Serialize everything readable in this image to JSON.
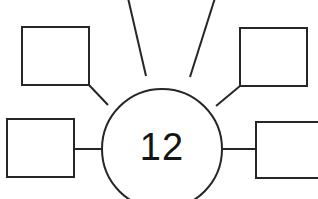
{
  "worksheet": {
    "type": "bubble-map",
    "title": "Number bubble map",
    "background_color": "#ffffff",
    "line_color": "#262626",
    "text_color": "#141414",
    "canvas": {
      "width": 318,
      "height": 199
    }
  },
  "center": {
    "label": "12",
    "shape": "circle",
    "cx": 162,
    "cy": 149,
    "r": 60,
    "fill": "#ffffff"
  },
  "nodes": [
    {
      "id": "node-top-left-offscreen",
      "label": "",
      "shape": "line-only",
      "note": "spoke exits top edge of image; box not visible"
    },
    {
      "id": "node-top-right-offscreen",
      "label": "",
      "shape": "line-only",
      "note": "spoke exits top edge of image; box not visible"
    },
    {
      "id": "node-upper-left",
      "label": "",
      "shape": "rect",
      "x": 22,
      "y": 27,
      "width": 67,
      "height": 58
    },
    {
      "id": "node-upper-right",
      "label": "",
      "shape": "rect",
      "x": 240,
      "y": 28,
      "width": 67,
      "height": 58
    },
    {
      "id": "node-middle-left",
      "label": "",
      "shape": "rect",
      "x": 7,
      "y": 119,
      "width": 67,
      "height": 58
    },
    {
      "id": "node-middle-right",
      "label": "",
      "shape": "rect",
      "x": 256,
      "y": 122,
      "width": 67,
      "height": 56
    }
  ],
  "connectors": [
    {
      "id": "connector-top-left",
      "x1": 146,
      "y1": 76,
      "x2": 128,
      "y2": -2
    },
    {
      "id": "connector-top-right",
      "x1": 190,
      "y1": 77,
      "x2": 215,
      "y2": -2
    },
    {
      "id": "connector-upper-left",
      "x1": 108,
      "y1": 105,
      "x2": 89,
      "y2": 85
    },
    {
      "id": "connector-upper-right",
      "x1": 216,
      "y1": 106,
      "x2": 240,
      "y2": 86
    },
    {
      "id": "connector-middle-left",
      "x1": 102,
      "y1": 149,
      "x2": 74,
      "y2": 149
    },
    {
      "id": "connector-middle-right",
      "x1": 222,
      "y1": 149,
      "x2": 256,
      "y2": 149
    }
  ]
}
